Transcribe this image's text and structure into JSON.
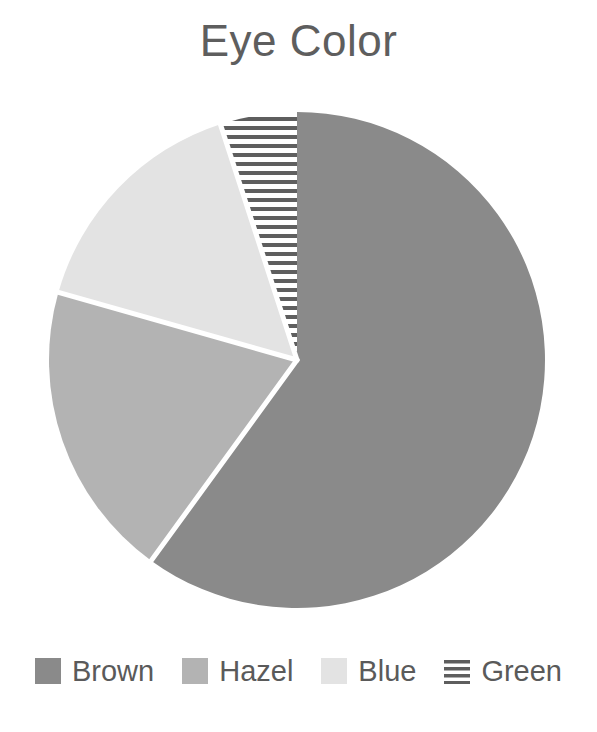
{
  "chart_data": {
    "type": "pie",
    "title": "Eye Color",
    "categories": [
      "Brown",
      "Hazel",
      "Blue",
      "Green"
    ],
    "values": [
      60,
      19.4,
      15.6,
      5
    ],
    "units": "percent",
    "start_angle_deg": 0,
    "direction": "clockwise",
    "slice_angles_deg": [
      216,
      70,
      56,
      18
    ],
    "slice_colors": [
      "#8a8a8a",
      "#b3b3b3",
      "#e3e3e3",
      "#ffffff"
    ],
    "slice_patterns": [
      "solid",
      "solid",
      "solid",
      "horizontal-stripes"
    ],
    "separator_color": "#ffffff",
    "legend_position": "bottom",
    "grid": false,
    "xlabel": "",
    "ylabel": ""
  },
  "chart": {
    "title": "Eye Color",
    "title_color": "#5e5e5e",
    "background": "#ffffff"
  },
  "legend": {
    "items": [
      {
        "label": "Brown",
        "color": "#8a8a8a",
        "pattern": "solid"
      },
      {
        "label": "Hazel",
        "color": "#b3b3b3",
        "pattern": "solid"
      },
      {
        "label": "Blue",
        "color": "#e3e3e3",
        "pattern": "solid"
      },
      {
        "label": "Green",
        "color": "#ffffff",
        "pattern": "horizontal-stripes"
      }
    ],
    "text_color": "#5a5a5a"
  }
}
